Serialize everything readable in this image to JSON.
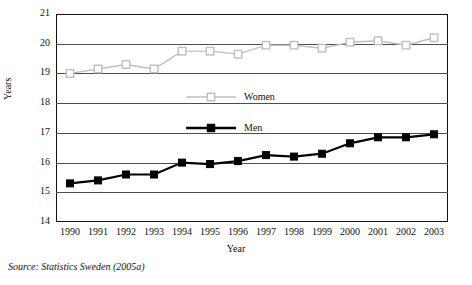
{
  "chart_data": {
    "type": "line",
    "title": "",
    "xlabel": "Year",
    "ylabel": "Years",
    "categories": [
      "1990",
      "1991",
      "1992",
      "1993",
      "1994",
      "1995",
      "1996",
      "1997",
      "1998",
      "1999",
      "2000",
      "2001",
      "2002",
      "2003"
    ],
    "ylim": [
      14,
      21
    ],
    "yticks": [
      "14",
      "15",
      "16",
      "17",
      "18",
      "19",
      "20",
      "21"
    ],
    "grid": "horizontal",
    "legend_position": "inside-center",
    "series": [
      {
        "name": "Women",
        "color": "#bfbfbf",
        "marker": "square-open",
        "values": [
          19.0,
          19.15,
          19.3,
          19.15,
          19.75,
          19.75,
          19.65,
          19.95,
          19.95,
          19.85,
          20.05,
          20.1,
          19.95,
          20.2
        ]
      },
      {
        "name": "Men",
        "color": "#000000",
        "marker": "square-filled",
        "values": [
          15.3,
          15.4,
          15.6,
          15.6,
          16.0,
          15.95,
          16.05,
          16.25,
          16.2,
          16.3,
          16.65,
          16.85,
          16.85,
          16.95
        ]
      }
    ],
    "source": "Source: Statistics Sweden (2005a)"
  }
}
